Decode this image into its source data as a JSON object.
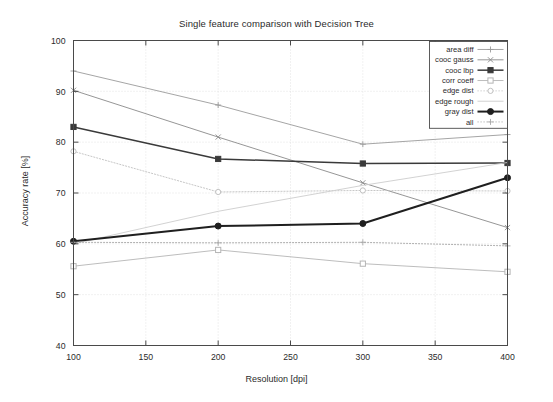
{
  "chart_data": {
    "type": "line",
    "title": "Single feature comparison with Decision Tree",
    "xlabel": "Resolution [dpi]",
    "ylabel": "Accuracy rate [%]",
    "x": [
      100,
      200,
      300,
      400
    ],
    "xlim": [
      100,
      400
    ],
    "ylim": [
      40,
      100
    ],
    "xticks": [
      100,
      150,
      200,
      250,
      300,
      350,
      400
    ],
    "yticks": [
      40,
      50,
      60,
      70,
      80,
      90,
      100
    ],
    "grid": true,
    "legend_position": "top-right",
    "series": [
      {
        "name": "area diff",
        "values": [
          94.0,
          87.3,
          79.6,
          81.5
        ],
        "color": "#9b9b9b",
        "marker": "plus",
        "linestyle": "solid",
        "width": 0.9
      },
      {
        "name": "cooc gauss",
        "values": [
          90.2,
          81.0,
          72.0,
          63.2
        ],
        "color": "#8a8a8a",
        "marker": "x",
        "linestyle": "solid",
        "width": 0.9
      },
      {
        "name": "cooc lbp",
        "values": [
          83.0,
          76.7,
          75.8,
          75.9
        ],
        "color": "#3a3a3a",
        "marker": "square-filled",
        "linestyle": "solid",
        "width": 1.5
      },
      {
        "name": "corr coeff",
        "values": [
          55.6,
          58.8,
          56.1,
          54.5
        ],
        "color": "#b5b5b5",
        "marker": "square-open",
        "linestyle": "solid",
        "width": 0.9
      },
      {
        "name": "edge dist",
        "values": [
          78.2,
          70.2,
          70.5,
          70.4
        ],
        "color": "#c0c0c0",
        "marker": "circle-open",
        "linestyle": "dotted",
        "width": 0.9
      },
      {
        "name": "edge rough",
        "values": [
          60.0,
          66.4,
          71.5,
          76.0
        ],
        "color": "#cdcdcd",
        "marker": "none",
        "linestyle": "solid",
        "width": 0.9
      },
      {
        "name": "gray dist",
        "values": [
          60.5,
          63.5,
          64.0,
          73.0
        ],
        "color": "#1f1f1f",
        "marker": "circle-filled",
        "linestyle": "solid",
        "width": 2.0
      },
      {
        "name": "all",
        "values": [
          60.3,
          60.2,
          60.3,
          59.6
        ],
        "color": "#a8a8a8",
        "marker": "plus",
        "linestyle": "dotted",
        "width": 0.9
      }
    ]
  }
}
